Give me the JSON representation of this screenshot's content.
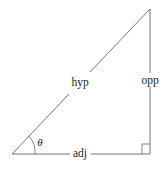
{
  "diagram": {
    "title": "",
    "type": "right-triangle",
    "colors": {
      "stroke": "#555555",
      "text": "#222222",
      "background": "#ffffff"
    },
    "vertices": {
      "angle_vertex": {
        "x": 12,
        "y": 154
      },
      "top_vertex": {
        "x": 150,
        "y": 9
      },
      "right_angle_vertex": {
        "x": 150,
        "y": 154
      }
    },
    "labels": {
      "hypotenuse": "hyp",
      "opposite": "opp",
      "adjacent": "adj",
      "angle": "θ"
    },
    "right_angle_marker": true
  }
}
